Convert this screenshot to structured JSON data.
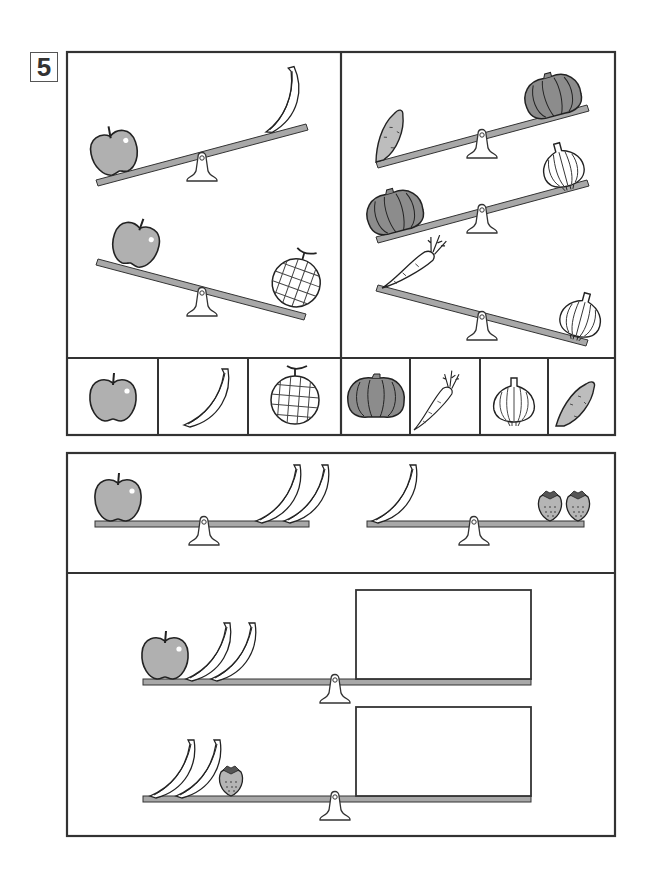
{
  "question": {
    "number": "5"
  },
  "colors": {
    "border": "#333333",
    "beam": "#a8a8a8",
    "apple": "#b0b0b0",
    "pumpkin": "#8c8c8c",
    "potato": "#bdbdbd",
    "strawberry": "#b5b5b5",
    "background": "#ffffff"
  },
  "top_panel": {
    "left_section": {
      "scales": [
        {
          "left_items": [
            "apple"
          ],
          "right_items": [
            "banana"
          ],
          "heavier_side": "left"
        },
        {
          "left_items": [
            "apple"
          ],
          "right_items": [
            "melon"
          ],
          "heavier_side": "right"
        }
      ]
    },
    "right_section": {
      "scales": [
        {
          "left_items": [
            "sweet-potato"
          ],
          "right_items": [
            "pumpkin"
          ],
          "heavier_side": "left"
        },
        {
          "left_items": [
            "pumpkin"
          ],
          "right_items": [
            "onion"
          ],
          "heavier_side": "left"
        },
        {
          "left_items": [
            "carrot"
          ],
          "right_items": [
            "onion"
          ],
          "heavier_side": "right"
        }
      ]
    },
    "answer_strip": {
      "cells": [
        "apple",
        "banana",
        "melon",
        "pumpkin",
        "carrot",
        "onion",
        "sweet-potato"
      ]
    }
  },
  "bottom_panel": {
    "example_scales": [
      {
        "left_items": [
          "apple"
        ],
        "right_items": [
          "banana",
          "banana"
        ],
        "balanced": true
      },
      {
        "left_items": [
          "banana"
        ],
        "right_items": [
          "strawberry",
          "strawberry"
        ],
        "balanced": true
      }
    ],
    "question_scales": [
      {
        "left_items": [
          "apple",
          "banana",
          "banana"
        ],
        "right_answer_box": ""
      },
      {
        "left_items": [
          "banana",
          "banana",
          "strawberry"
        ],
        "right_answer_box": ""
      }
    ]
  }
}
